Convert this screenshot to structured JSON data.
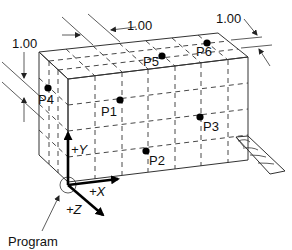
{
  "diagram": {
    "dimensions": {
      "left": "1.00",
      "top_middle": "1.00",
      "top_right": "1.00"
    },
    "points": [
      {
        "id": "P1",
        "label": "P1"
      },
      {
        "id": "P2",
        "label": "P2"
      },
      {
        "id": "P3",
        "label": "P3"
      },
      {
        "id": "P4",
        "label": "P4"
      },
      {
        "id": "P5",
        "label": "P5"
      },
      {
        "id": "P6",
        "label": "P6"
      }
    ],
    "axes": {
      "x": "+X",
      "y": "+Y",
      "z": "+Z"
    },
    "origin_label": "Program"
  }
}
